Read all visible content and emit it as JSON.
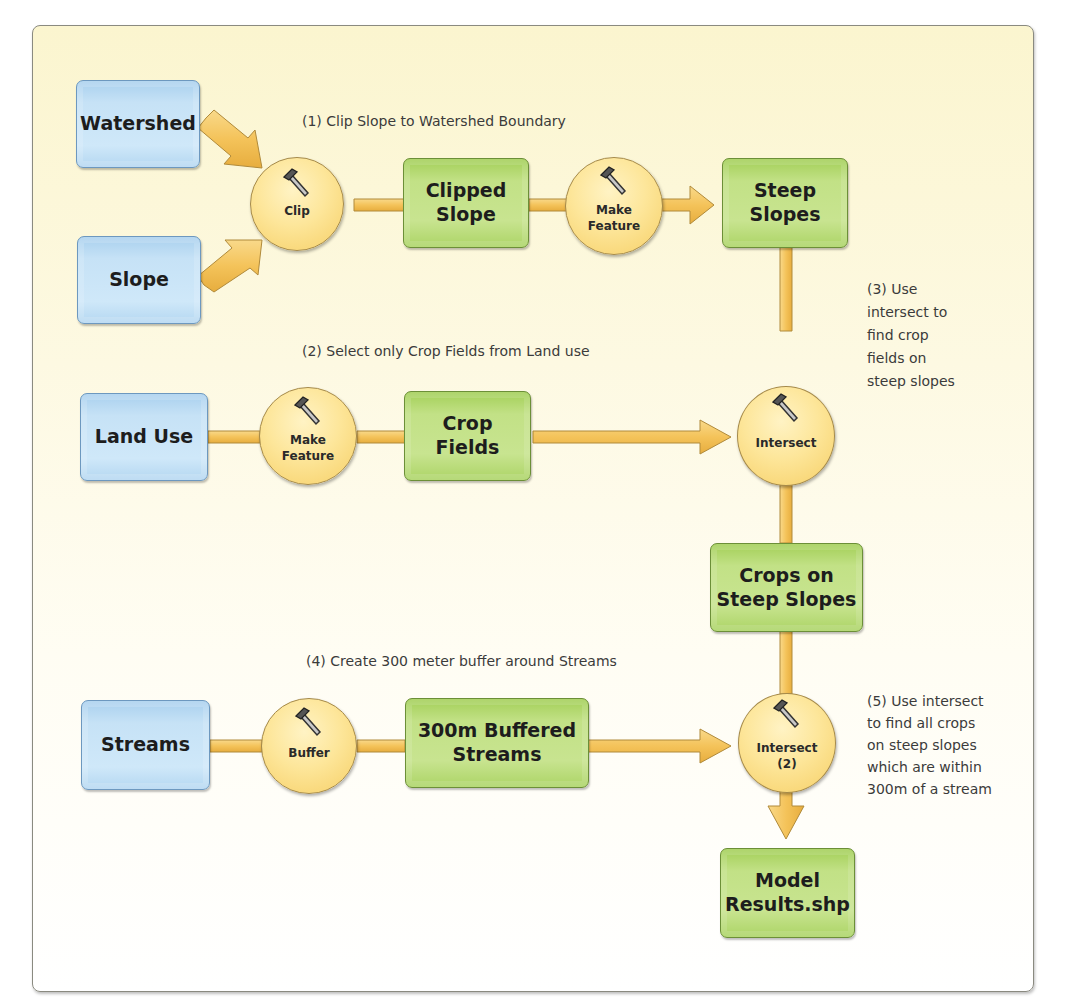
{
  "diagram": {
    "title": "",
    "type": "ModelBuilder workflow",
    "inputs": [
      {
        "id": "watershed",
        "label": "Watershed"
      },
      {
        "id": "slope",
        "label": "Slope"
      },
      {
        "id": "land_use",
        "label": "Land Use"
      },
      {
        "id": "streams",
        "label": "Streams"
      }
    ],
    "tools": [
      {
        "id": "clip",
        "label": "Clip"
      },
      {
        "id": "make_feature_1",
        "label_line1": "Make",
        "label_line2": "Feature"
      },
      {
        "id": "make_feature_2",
        "label_line1": "Make",
        "label_line2": "Feature"
      },
      {
        "id": "intersect",
        "label": "Intersect"
      },
      {
        "id": "buffer",
        "label": "Buffer"
      },
      {
        "id": "intersect_2",
        "label_line1": "Intersect",
        "label_line2": "(2)"
      }
    ],
    "outputs": [
      {
        "id": "clipped_slope",
        "line1": "Clipped",
        "line2": "Slope"
      },
      {
        "id": "steep_slopes",
        "line1": "Steep",
        "line2": "Slopes"
      },
      {
        "id": "crop_fields",
        "line1": "Crop",
        "line2": "Fields"
      },
      {
        "id": "crops_on_steep_slopes",
        "line1": "Crops on",
        "line2": "Steep Slopes"
      },
      {
        "id": "buffered_streams",
        "line1": "300m Buffered",
        "line2": "Streams"
      },
      {
        "id": "model_results",
        "line1": "Model",
        "line2": "Results.shp"
      }
    ],
    "notes": [
      {
        "id": "step1",
        "lines": [
          "(1) Clip Slope to Watershed Boundary"
        ]
      },
      {
        "id": "step2",
        "lines": [
          "(2) Select only Crop Fields from Land use"
        ]
      },
      {
        "id": "step3",
        "lines": [
          "(3) Use",
          "intersect to",
          "find crop",
          "fields on",
          "steep slopes"
        ]
      },
      {
        "id": "step4",
        "lines": [
          "(4) Create 300 meter buffer around Streams"
        ]
      },
      {
        "id": "step5",
        "lines": [
          "(5) Use intersect",
          "to find all crops",
          "on steep slopes",
          "which are within",
          "300m of a stream"
        ]
      }
    ],
    "edges": [
      [
        "Watershed",
        "Clip"
      ],
      [
        "Slope",
        "Clip"
      ],
      [
        "Clip",
        "Clipped Slope"
      ],
      [
        "Clipped Slope",
        "Make Feature"
      ],
      [
        "Make Feature",
        "Steep Slopes"
      ],
      [
        "Land Use",
        "Make Feature"
      ],
      [
        "Make Feature",
        "Crop Fields"
      ],
      [
        "Crop Fields",
        "Intersect"
      ],
      [
        "Steep Slopes",
        "Intersect"
      ],
      [
        "Intersect",
        "Crops on Steep Slopes"
      ],
      [
        "Crops on Steep Slopes",
        "Intersect (2)"
      ],
      [
        "Streams",
        "Buffer"
      ],
      [
        "Buffer",
        "300m Buffered Streams"
      ],
      [
        "300m Buffered Streams",
        "Intersect (2)"
      ],
      [
        "Intersect (2)",
        "Model Results.shp"
      ]
    ],
    "colors": {
      "input_fill": "#c6e2f6",
      "output_fill": "#c2e186",
      "tool_fill": "#fde69a",
      "connector": "#f6c95f",
      "panel_bg": "#fbf5cf"
    }
  }
}
